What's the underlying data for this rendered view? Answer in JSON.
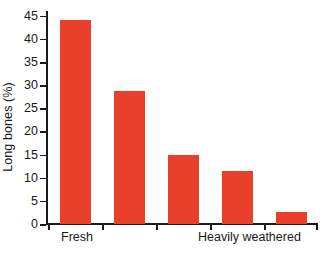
{
  "chart_data": {
    "type": "bar",
    "title": "",
    "subtitle": "",
    "xlabel": "",
    "ylabel": "Long bones (%)",
    "categories": [
      "1",
      "2",
      "3",
      "4",
      "5"
    ],
    "values": [
      44,
      28.8,
      15,
      11.5,
      2.7
    ],
    "series": [
      {
        "name": "Long bones",
        "values": [
          44,
          28.8,
          15,
          11.5,
          2.7
        ]
      }
    ],
    "ylim": [
      0,
      46
    ],
    "ytick_values": [
      0,
      5,
      10,
      15,
      20,
      25,
      30,
      35,
      40,
      45
    ],
    "ytick_labels": [
      "0",
      "5",
      "10",
      "15",
      "20",
      "25",
      "30",
      "35",
      "40",
      "45"
    ],
    "xtick_labels": [
      "Fresh",
      "Heavily weathered"
    ],
    "x_axis_endpoint_labels": {
      "left": "Fresh",
      "right": "Heavily weathered"
    },
    "grid": false,
    "legend": false,
    "legend_position": "none",
    "bar_color": "#e8402a",
    "axis_color": "#1a1a1a",
    "background_color": "#ffffff"
  }
}
